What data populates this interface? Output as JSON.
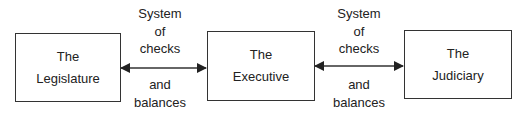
{
  "diagram": {
    "nodes": [
      {
        "id": "legislature",
        "lines": [
          "The",
          "Legislature"
        ]
      },
      {
        "id": "executive",
        "lines": [
          "The",
          "Executive"
        ]
      },
      {
        "id": "judiciary",
        "lines": [
          "The",
          "Judiciary"
        ]
      }
    ],
    "edges": [
      {
        "from": "legislature",
        "to": "executive",
        "type": "bidirectional",
        "label_top": [
          "System",
          "of",
          "checks"
        ],
        "label_bottom": [
          "and",
          "balances"
        ]
      },
      {
        "from": "executive",
        "to": "judiciary",
        "type": "bidirectional",
        "label_top": [
          "System",
          "of",
          "checks"
        ],
        "label_bottom": [
          "and",
          "balances"
        ]
      }
    ],
    "colors": {
      "stroke": "#333333",
      "text": "#222222",
      "background": "#ffffff"
    }
  }
}
